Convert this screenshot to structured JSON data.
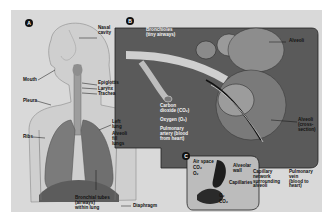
{
  "figure": {
    "colors": {
      "background": "#ffffff",
      "panel": "#d9d9d9",
      "panel_b": "#5a5a5a",
      "ink": "#111111"
    },
    "panels": [
      {
        "id": "A",
        "badge": "A",
        "labels": {
          "nasal_cavity": "Nasal\ncavity",
          "mouth": "Mouth",
          "epiglottis": "Epiglottis",
          "larynx": "Larynx",
          "trachea": "Trachea",
          "pleura": "Pleura",
          "ribs": "Ribs",
          "left_lung": "Left\nlung",
          "alveoli_fill_lungs": "Alveoli\nfill\nlungs",
          "bronchial_tubes": "Bronchial tubes\n(airways)\nwithin lung",
          "diaphragm": "Diaphragm"
        }
      },
      {
        "id": "B",
        "badge": "B",
        "labels": {
          "bronchioles": "Bronchioles\n(tiny airways)",
          "alveoli": "Alveoli",
          "carbon_dioxide": "Carbon\ndioxide (CO₂)",
          "oxygen": "Oxygen (O₂)",
          "pulmonary_artery": "Pulmonary\nartery (blood\nfrom heart)",
          "alveoli_cross_section": "Alveoli\n(cross-\nsection)",
          "capillary_network": "Capillary\nnetwork\nsurrounding\nalveoli",
          "pulmonary_vein": "Pulmonary\nvein\n(blood to\nheart)"
        }
      },
      {
        "id": "C",
        "badge": "C",
        "labels": {
          "air_space": "Air space",
          "co2_air": "CO₂",
          "o2_air": "O₂",
          "alveolar_wall": "Alveolar\nwall",
          "capillaries": "Capillaries",
          "o2_blood": "O₂",
          "co2_blood": "CO₂"
        }
      }
    ]
  }
}
